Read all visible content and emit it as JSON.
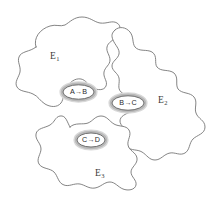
{
  "figure": {
    "type": "set-region-diagram",
    "background_color": "#ffffff",
    "outline_color": "#6e6e6e",
    "halo_color": "#c8c8c8",
    "regions": [
      {
        "id": "E1",
        "label": "E",
        "subscript": "1",
        "name": "region-e1"
      },
      {
        "id": "E2",
        "label": "E",
        "subscript": "2",
        "name": "region-e2"
      },
      {
        "id": "E3",
        "label": "E",
        "subscript": "3",
        "name": "region-e3"
      }
    ],
    "nodes": [
      {
        "id": "AB",
        "label": "A→B",
        "name": "node-a-to-b"
      },
      {
        "id": "BC",
        "label": "B→C",
        "name": "node-b-to-c"
      },
      {
        "id": "CD",
        "label": "C→D",
        "name": "node-c-to-d"
      }
    ]
  }
}
